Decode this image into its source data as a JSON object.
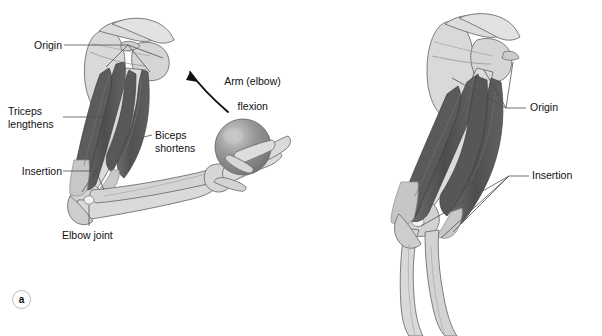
{
  "figure": {
    "background_color": "#ffffff",
    "label_color": "#111111",
    "leader_line_color": "#5a5a5a",
    "bone_fill": "#d8d8d8",
    "bone_outline": "#6e6e6e",
    "muscle_dark": "#565656",
    "muscle_mid": "#6e6e6e",
    "tendon_light": "#c9c9c9",
    "ball_fill": "#8a8a8a",
    "ball_highlight": "#c4c4c4"
  },
  "panel_a": {
    "marker": "a",
    "marker_name": "panel-marker-a",
    "labels": {
      "origin": "Origin",
      "triceps": "Triceps\nlengthens",
      "insertion": "Insertion",
      "biceps": "Biceps\nshortens",
      "elbow_joint": "Elbow joint",
      "arm_flexion_line1": "Arm (elbow)",
      "arm_flexion_line2": "flexion"
    },
    "structures": [
      "scapula",
      "clavicle",
      "humerus",
      "radius",
      "ulna",
      "hand-bones",
      "biceps-brachii",
      "triceps-brachii",
      "ball"
    ],
    "arrow": {
      "name": "flexion-arrow",
      "description": "curved arrow pointing up-left indicating elbow flexion"
    }
  },
  "panel_b": {
    "marker": "b",
    "marker_name": "panel-marker-b",
    "labels": {
      "origin": "Origin",
      "insertion": "Insertion"
    },
    "structures": [
      "scapula",
      "clavicle",
      "humerus",
      "radius",
      "ulna",
      "biceps-brachii",
      "triceps-brachii"
    ]
  }
}
